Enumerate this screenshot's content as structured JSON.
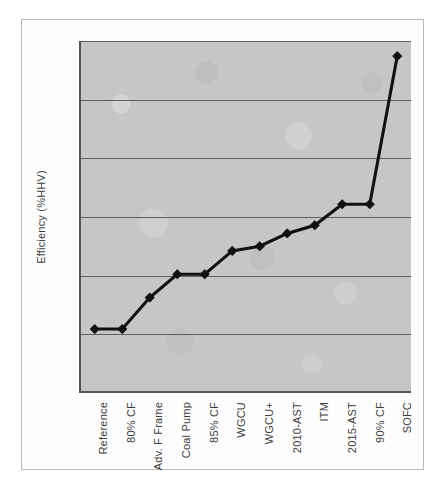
{
  "chart_data": {
    "type": "line",
    "title": "",
    "xlabel": "",
    "ylabel": "Efficiency (%HHV)",
    "ylim": [
      30,
      60
    ],
    "ytick_step": 5,
    "ytick_labels": [
      "60%",
      "55%",
      "50%",
      "45%",
      "40%",
      "35%",
      "30%"
    ],
    "ytick_values": [
      60,
      55,
      50,
      45,
      40,
      35,
      30
    ],
    "grid": true,
    "legend": "none",
    "marker": "diamond",
    "line_color": "#111111",
    "plot_background": "#c6c6c6",
    "categories": [
      "Reference",
      "80% CF",
      "Adv. F Frame",
      "Coal Pump",
      "85% CF",
      "WGCU",
      "WGCU+",
      "2010-AST",
      "ITM",
      "2015-AST",
      "90% CF",
      "SOFC"
    ],
    "values": [
      35.3,
      35.3,
      38.0,
      40.0,
      40.0,
      42.0,
      42.4,
      43.5,
      44.2,
      46.0,
      46.0,
      58.7
    ]
  },
  "caption": {
    "text": ""
  }
}
